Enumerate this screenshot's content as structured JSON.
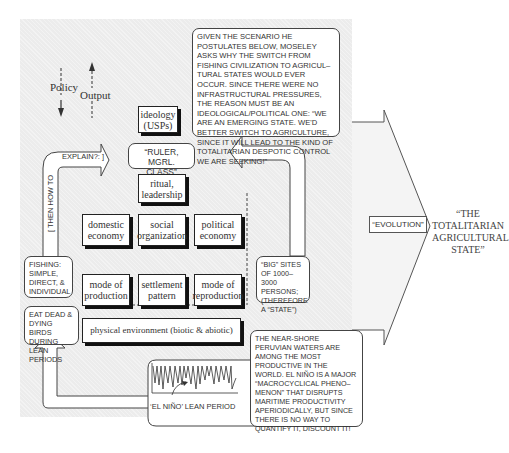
{
  "legend": {
    "policy_label": "Policy",
    "output_label": "Output"
  },
  "boxes": {
    "ideology": "ideology\n(USPs)",
    "ideology_line1": "ideology",
    "ideology_line2": "(USPs)",
    "ritual_line1": "ritual,",
    "ritual_line2": "leadership",
    "domestic_line1": "domestic",
    "domestic_line2": "economy",
    "social_line1": "social",
    "social_line2": "organization",
    "political_line1": "political",
    "political_line2": "economy",
    "mode_prod_line1": "mode of",
    "mode_prod_line2": "production",
    "settlement_line1": "settlement",
    "settlement_line2": "pattern",
    "mode_repro_line1": "mode of",
    "mode_repro_line2": "reproduction",
    "physical_env": "physical environment (biotic & abiotic)"
  },
  "notes": {
    "top_note": "GIVEN THE SCENARIO HE POSTULATES BELOW, MOSELEY ASKS WHY THE SWITCH FROM FISHING CIVILIZATION TO AGRICUL– TURAL STATES WOULD EVER OCCUR. SINCE THERE WERE NO INFRASTRUCTURAL PRESSURES, THE REASON MUST BE AN IDEOLOGICAL/POLITICAL ONE: “WE ARE AN EMERGING STATE. WE'D BETTER SWITCH TO AGRICULTURE, SINCE IT WILL LEAD TO THE KIND OF TOTALITARIAN DESPOTIC CONTROL WE ARE SEEKING!”",
    "ruler_class": "“RULER, MGRL. CLASS”",
    "fishing": "FISHING: SIMPLE, DIRECT, & INDIVIDUAL",
    "big_sites": "“BIG” SITES OF 1000–3000 PERSONS; (THEREFORE A “STATE”)",
    "eat_dead": "EAT DEAD & DYING BIRDS DURING LEAN PERIODS",
    "peruvian": "THE NEAR-SHORE PERUVIAN WATERS ARE AMONG THE MOST PRODUCTIVE IN THE WORLD. EL NIÑO IS A MAJOR “MACROCYCLICAL PHENO– MENON” THAT DISRUPTS MARITIME PRODUCTIVITY APERIODICALLY, BUT SINCE THERE IS NO WAY TO QUANTIFY IT, DISCOUNT IT!",
    "el_nino_label": "‘EL NIÑO’ LEAN PERIOD"
  },
  "arrows": {
    "then_how": "[ THEN HOW TO",
    "explain": "EXPLAIN?: ]"
  },
  "evolution": {
    "label": "“EVOLUTION”",
    "result": "“THE TOTALITARIAN AGRICULTURAL STATE”"
  },
  "colors": {
    "panel": "#ececec",
    "box_border": "#222222",
    "text": "#333333"
  }
}
